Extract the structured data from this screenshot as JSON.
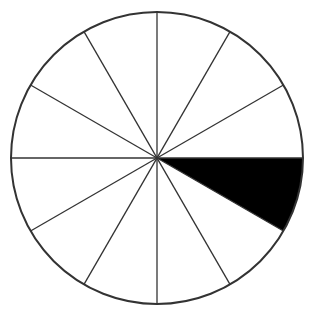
{
  "diagram": {
    "type": "fraction-circle",
    "total_slices": 12,
    "shaded_slices": 1,
    "shaded_fraction": "1/12",
    "shaded_start_angle_deg": 0,
    "shaded_end_angle_deg": 30,
    "center": [
      157,
      158
    ],
    "radius": 146,
    "colors": {
      "fill": "#ffffff",
      "stroke": "#333333",
      "shade": "#000000"
    }
  }
}
